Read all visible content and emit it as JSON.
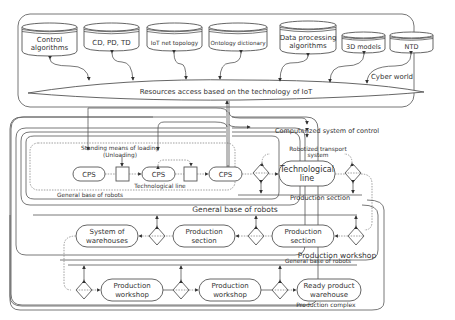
{
  "cyber_world": {
    "label": "Cyber world",
    "databases": [
      {
        "id": "control",
        "line1": "Control",
        "line2": "algorithms"
      },
      {
        "id": "cdpdtd",
        "line1": "CD, PD, TD",
        "line2": ""
      },
      {
        "id": "iot-topology",
        "line1": "IoT net topology",
        "line2": ""
      },
      {
        "id": "ontology",
        "line1": "Ontology dictionary",
        "line2": ""
      },
      {
        "id": "data-processing",
        "line1": "Data processing",
        "line2": "algorithms"
      },
      {
        "id": "3d-models",
        "line1": "3D models",
        "line2": ""
      },
      {
        "id": "ntd",
        "line1": "NTD",
        "line2": ""
      }
    ],
    "bus_label": "Resources access based on the technology of IoT"
  },
  "control": {
    "label": "Computerized system of control"
  },
  "production_section_1": {
    "standing_means": "Standing means of loading",
    "unloading": "(Unloading)",
    "cps_1": "CPS",
    "cps_2": "CPS",
    "cps_3": "CPS",
    "tech_line_label": "Technological line",
    "gbr_label": "General base of robots",
    "transport_label_1": "Robotized transport",
    "transport_label_2": "system",
    "tech_line_box_1": "Technological",
    "tech_line_box_2": "line",
    "section_label": "Production section"
  },
  "workshop": {
    "gbr_label": "General base of robots",
    "warehouses_1": "System of",
    "warehouses_2": "warehouses",
    "section_a_1": "Production",
    "section_a_2": "section",
    "section_b_1": "Production",
    "section_b_2": "section",
    "label": "Production workshop"
  },
  "complex": {
    "gbr_label": "General base of robots",
    "workshop_a_1": "Production",
    "workshop_a_2": "workshop",
    "workshop_b_1": "Production",
    "workshop_b_2": "workshop",
    "ready_1": "Ready product",
    "ready_2": "warehouse",
    "label": "Production complex"
  }
}
